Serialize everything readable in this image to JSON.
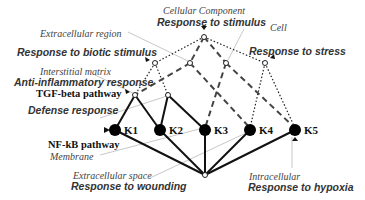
{
  "diagram": {
    "labels": {
      "cellular_component": "Cellular Component",
      "response_to_stimulus": "Response to stimulus",
      "cell": "Cell",
      "extracellular_region": "Extracellular region",
      "response_to_biotic_stimulus": "Response to biotic stimulus",
      "response_to_stress": "Response to stress",
      "interstitial_matrix": "Interstitial matrix",
      "anti_inflammatory_response": "Anti-inflammatory response",
      "tgf_beta_pathway": "TGF-beta pathway",
      "defense_response": "Defense response",
      "nfkb_pathway": "NF-kB pathway",
      "membrane": "Membrane",
      "extracellular_space": "Extracellular space",
      "response_to_wounding": "Response to wounding",
      "intracellular": "Intracellular",
      "response_to_hypoxia": "Response to hypoxia"
    },
    "kinases": [
      "K1",
      "K2",
      "K3",
      "K4",
      "K5"
    ],
    "edge_styles": {
      "solid": "Biological process (direct)",
      "dashed": "Cellular component",
      "dotted": "Biological process (hierarchy)"
    },
    "colors": {
      "line": "#111111",
      "pointer": "#bbbbbb",
      "node": "#000000"
    }
  }
}
